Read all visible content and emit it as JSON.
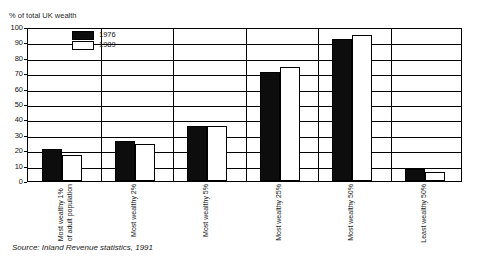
{
  "top_caption": "",
  "axis": {
    "y_title": "% of total UK wealth",
    "y_ticks": [
      "100",
      "90",
      "80",
      "70",
      "60",
      "50",
      "40",
      "30",
      "20",
      "10",
      "0"
    ]
  },
  "legend": {
    "items": [
      {
        "label": "1976",
        "swatch": "solid-black"
      },
      {
        "label": "1989",
        "swatch": "outlined-white"
      }
    ]
  },
  "source": "Source: Inland Revenue statistics, 1991",
  "chart_data": {
    "type": "bar",
    "title": "",
    "subtitle": "",
    "xlabel": "",
    "ylabel": "% of total UK wealth",
    "ylim": [
      0,
      100
    ],
    "ytick_step": 10,
    "grid": true,
    "legend_position": "inside-top-left",
    "categories": [
      "Most wealthy 1% of adult population",
      "Most wealthy 2%",
      "Most wealthy 5%",
      "Most wealthy 25%",
      "Most wealthy 50%",
      "Least wealthy 50%"
    ],
    "category_lines": [
      [
        "Most wealthy 1%",
        "of adult population"
      ],
      [
        "Most wealthy 2%",
        ""
      ],
      [
        "Most wealthy 5%",
        ""
      ],
      [
        "Most wealthy 25%",
        ""
      ],
      [
        "Most wealthy 50%",
        ""
      ],
      [
        "Least wealthy 50%",
        ""
      ]
    ],
    "series": [
      {
        "name": "1976",
        "color": "#0d0d0d",
        "values": [
          21,
          26,
          36,
          71,
          92,
          8
        ]
      },
      {
        "name": "1989",
        "color": "#ffffff",
        "values": [
          17,
          24,
          36,
          74,
          95,
          6
        ]
      }
    ]
  }
}
